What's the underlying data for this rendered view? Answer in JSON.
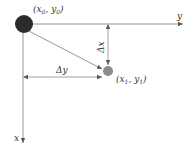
{
  "diagram": {
    "type": "coordinate-displacement",
    "colors": {
      "line": "#8a8a8a",
      "origin_point": "#2b2b2b",
      "target_point": "#8c8c8c",
      "text": "#333333"
    },
    "axes": {
      "x_label": "x",
      "y_label": "y"
    },
    "points": {
      "origin": {
        "label_open": "(",
        "var1": "x",
        "sub1": "0",
        "sep": ", ",
        "var2": "y",
        "sub2": "0",
        "label_close": ")"
      },
      "target": {
        "label_open": "(",
        "var1": "x",
        "sub1": "1",
        "sep": ", ",
        "var2": "y",
        "sub2": "1",
        "label_close": ")"
      }
    },
    "dimensions": {
      "dx_label": "Δx",
      "dy_label": "Δy"
    }
  }
}
